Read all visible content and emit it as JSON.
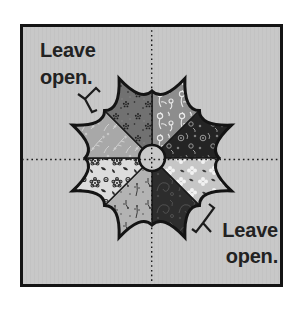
{
  "diagram": {
    "labels": {
      "top_left": {
        "line1": "Leave",
        "line2": "open."
      },
      "bottom_right": {
        "line1": "Leave",
        "line2": "open."
      }
    },
    "colors": {
      "page_bg": "#ffffff",
      "panel_bg": "#c8c8c8",
      "panel_texture": "#c1c1c1",
      "border": "#141414",
      "outline": "#141414",
      "seam": "#1a1a1a",
      "centerline": "#1a1a1a",
      "bracket": "#1c1c1c",
      "label_text": "#222222",
      "center_circle_fill": "#c9c9c9"
    },
    "fabrics": [
      {
        "position": "top-right",
        "name": "gray-floral-print",
        "base": "#8d8d8d",
        "motif": "#e9e9e9"
      },
      {
        "position": "upper-right",
        "name": "black-rings-print",
        "base": "#242424",
        "motif": "#979797"
      },
      {
        "position": "lower-right",
        "name": "light-clover-print",
        "base": "#c6c6c6",
        "motif": "#f2f2f2",
        "accent": "#3f3f3f"
      },
      {
        "position": "bottom-right",
        "name": "dark-paisley-print",
        "base": "#2d2d2d",
        "motif": "#4f4f4f"
      },
      {
        "position": "bottom-left",
        "name": "light-sprig-print",
        "base": "#b3b3b3",
        "motif": "#3a3a3a"
      },
      {
        "position": "lower-left",
        "name": "white-flower-print",
        "base": "#dcdcdc",
        "motif": "#2b2b2b"
      },
      {
        "position": "upper-left",
        "name": "gray-sprig-print",
        "base": "#a8a8a8",
        "motif": "#d4d4d4"
      },
      {
        "position": "top-left",
        "name": "dark-ditsy-print",
        "base": "#717171",
        "motif": "#1f1f1f",
        "accent": "#8a8a8a"
      }
    ]
  }
}
